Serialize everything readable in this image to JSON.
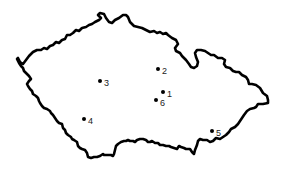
{
  "map": {
    "region": "Czech Republic outline",
    "colors": {
      "border": "#000000",
      "fill": "#ffffff",
      "points": "#000000",
      "labels": "#222222"
    },
    "points": [
      {
        "label": "1",
        "x": 163,
        "y": 92
      },
      {
        "label": "2",
        "x": 158,
        "y": 69
      },
      {
        "label": "3",
        "x": 100,
        "y": 81
      },
      {
        "label": "4",
        "x": 84,
        "y": 119
      },
      {
        "label": "5",
        "x": 212,
        "y": 131
      },
      {
        "label": "6",
        "x": 156,
        "y": 100
      }
    ]
  }
}
